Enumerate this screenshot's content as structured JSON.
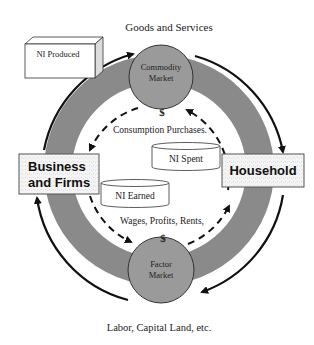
{
  "diagram": {
    "title_top": "Goods and Services",
    "title_bottom": "Labor, Capital Land, etc.",
    "nodes": {
      "commodity_market": {
        "line1": "Commodity",
        "line2": "Market"
      },
      "factor_market": {
        "line1": "Factor",
        "line2": "Market"
      },
      "business": {
        "line1": "Business",
        "line2": "and Firms"
      },
      "household": {
        "label": "Household"
      },
      "ni_produced": {
        "label": "NI Produced"
      },
      "ni_spent": {
        "label": "NI Spent"
      },
      "ni_earned": {
        "label": "NI Earned"
      }
    },
    "flows": {
      "consumption": "Consumption Purchases.",
      "wages": "Wages, Profits, Rents,",
      "dollar_top": "$",
      "dollar_bottom": "$"
    },
    "colors": {
      "ring": "#8a8a8a",
      "market_circle": "#9a9a9a",
      "box_fill": "#f2f2f2",
      "stroke": "#222222"
    }
  }
}
